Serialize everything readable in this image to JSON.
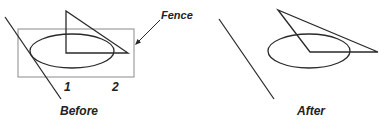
{
  "diagram": {
    "before_panel": {
      "caption": "Before",
      "fence_label": "Fence",
      "pick_points": [
        "1",
        "2"
      ]
    },
    "after_panel": {
      "caption": "After"
    },
    "colors": {
      "stroke": "#2a2a2a",
      "fence_stroke": "#8a8a8a",
      "text": "#222222"
    }
  }
}
